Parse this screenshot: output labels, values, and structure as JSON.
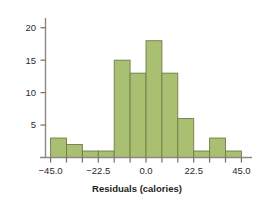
{
  "figure": {
    "name": "residuals-histogram",
    "background_color": "#ffffff"
  },
  "axes": {
    "x": {
      "title": "Residuals (calories)",
      "tick_labels": [
        "-45.0",
        "-22.5",
        "0.0",
        "22.5",
        "45.0"
      ],
      "tick_values": [
        -45.0,
        -22.5,
        0.0,
        22.5,
        45.0
      ],
      "minor_tick_values": [
        -45.0,
        -37.5,
        -30.0,
        -22.5,
        -15.0,
        -7.5,
        0.0,
        7.5,
        15.0,
        22.5,
        30.0,
        37.5,
        45.0
      ],
      "range": [
        -50.0,
        50.0
      ]
    },
    "y": {
      "title": "",
      "tick_labels": [
        "5",
        "10",
        "15",
        "20"
      ],
      "tick_values": [
        5,
        10,
        15,
        20
      ],
      "range": [
        0,
        21.5
      ]
    }
  },
  "style": {
    "bar_fill": "#a9bf71",
    "bar_edge": "#6f7d44",
    "axis_color": "#8a8a82",
    "text_color": "#2b2b2b"
  },
  "chart_data": {
    "type": "bar",
    "title": "",
    "subtitle": "",
    "xlabel": "Residuals (calories)",
    "ylabel": "",
    "grid": false,
    "legend": false,
    "bin_width": 7.5,
    "bin_edges": [
      -45.0,
      -37.5,
      -30.0,
      -22.5,
      -15.0,
      -7.5,
      0.0,
      7.5,
      15.0,
      22.5,
      30.0,
      37.5,
      45.0
    ],
    "categories": [
      "-45.0 to -37.5",
      "-37.5 to -30.0",
      "-30.0 to -22.5",
      "-22.5 to -15.0",
      "-15.0 to -7.5",
      "-7.5 to 0.0",
      "0.0 to 7.5",
      "7.5 to 15.0",
      "15.0 to 22.5",
      "22.5 to 30.0",
      "30.0 to 37.5",
      "37.5 to 45.0"
    ],
    "values": [
      3,
      2,
      1,
      1,
      15,
      13,
      18,
      13,
      6,
      1,
      3,
      1
    ],
    "xlim": [
      -50.0,
      50.0
    ],
    "ylim": [
      0,
      21.5
    ]
  }
}
